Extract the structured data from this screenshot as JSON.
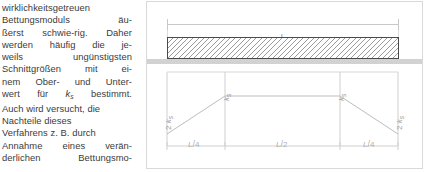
{
  "body_text": {
    "lines": [
      {
        "justify": false,
        "words": [
          "wirklichkeitsgetreuen"
        ]
      },
      {
        "justify": true,
        "words": [
          "Bettungsmoduls",
          "äu-"
        ]
      },
      {
        "justify": true,
        "words": [
          "ßerst",
          "schwie-rig.",
          "Daher"
        ]
      },
      {
        "justify": true,
        "words": [
          "werden",
          "häufig",
          "die",
          "je-"
        ]
      },
      {
        "justify": true,
        "words": [
          "weils",
          "ungünstigsten"
        ]
      },
      {
        "justify": true,
        "words": [
          "Schnittgrößen",
          "mit",
          "ei-"
        ]
      },
      {
        "justify": true,
        "words": [
          "nem",
          "Ober-",
          "und",
          "Unter-"
        ]
      },
      {
        "justify": true,
        "words": [
          "wert",
          "für",
          "__KS__",
          "bestimmt."
        ]
      },
      {
        "justify": false,
        "words": [
          "Auch wird versucht, die"
        ]
      },
      {
        "justify": false,
        "words": [
          "Nachteile dieses"
        ]
      },
      {
        "justify": false,
        "words": [
          "Verfahrens z. B. durch"
        ]
      },
      {
        "justify": true,
        "words": [
          "Annahme",
          "eines",
          "verän-"
        ]
      },
      {
        "justify": true,
        "words": [
          "derlichen",
          "Bettungsmo-"
        ]
      }
    ],
    "symbol_ks": {
      "base": "k",
      "sub": "s"
    }
  },
  "figure": {
    "beam_dimension_label": "L",
    "ground_label": "",
    "bedding_labels": {
      "edge_left": {
        "prefix": "2 ",
        "base": "k",
        "sub": "s"
      },
      "mid_left": {
        "prefix": "",
        "base": "k",
        "sub": "s"
      },
      "mid_right": {
        "prefix": "",
        "base": "k",
        "sub": "s"
      },
      "edge_right": {
        "prefix": "2 ",
        "base": "k",
        "sub": "s"
      }
    },
    "span_labels": [
      {
        "num": "L",
        "den": "4"
      },
      {
        "num": "L",
        "den": "2"
      },
      {
        "num": "L",
        "den": "4"
      }
    ]
  },
  "colors": {
    "text": "#3b3b3b",
    "beam_border": "#4a4a4a",
    "hatch": "#9a9a9a",
    "ground": "#d2d2d2",
    "dimension": "#c8c8c8",
    "diagram_line": "#bdbdbd",
    "frame": "#d9d9d9"
  }
}
